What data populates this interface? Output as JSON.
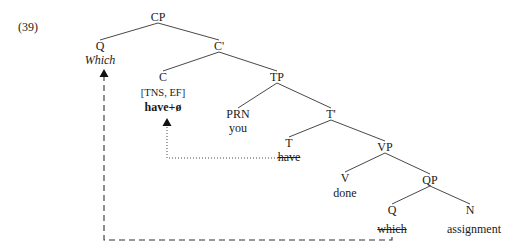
{
  "example": {
    "number": "(39)"
  },
  "tree": {
    "nodes": [
      {
        "id": "cp",
        "label": "CP",
        "x": 158,
        "y": 20
      },
      {
        "id": "q1",
        "label": "Q",
        "x": 100,
        "y": 49
      },
      {
        "id": "cbar",
        "label": "C'",
        "x": 219,
        "y": 49
      },
      {
        "id": "c",
        "label": "C",
        "x": 163,
        "y": 80
      },
      {
        "id": "tp",
        "label": "TP",
        "x": 277,
        "y": 80
      },
      {
        "id": "prn",
        "label": "PRN",
        "x": 238,
        "y": 117
      },
      {
        "id": "tbar",
        "label": "T'",
        "x": 331,
        "y": 117
      },
      {
        "id": "t",
        "label": "T",
        "x": 289,
        "y": 146
      },
      {
        "id": "vp",
        "label": "VP",
        "x": 385,
        "y": 150
      },
      {
        "id": "v",
        "label": "V",
        "x": 345,
        "y": 181
      },
      {
        "id": "qp",
        "label": "QP",
        "x": 430,
        "y": 183
      },
      {
        "id": "q2",
        "label": "Q",
        "x": 392,
        "y": 213
      },
      {
        "id": "n",
        "label": "N",
        "x": 470,
        "y": 213
      }
    ],
    "terminals": [
      {
        "id": "which-top",
        "text": "Which",
        "x": 100,
        "y": 63,
        "style": "italic"
      },
      {
        "id": "have-plus",
        "text": "have+ø",
        "x": 163,
        "y": 110,
        "style": "bold"
      },
      {
        "id": "you",
        "text": "you",
        "x": 238,
        "y": 131,
        "style": "plain"
      },
      {
        "id": "have-trace",
        "text": "have",
        "x": 289,
        "y": 160,
        "style": "struck"
      },
      {
        "id": "done",
        "text": "done",
        "x": 345,
        "y": 196,
        "style": "plain"
      },
      {
        "id": "which-trace",
        "text": "which",
        "x": 392,
        "y": 232,
        "style": "struck"
      },
      {
        "id": "assignment",
        "text": "assignment",
        "x": 474,
        "y": 232,
        "style": "plain"
      }
    ],
    "features": [
      {
        "id": "c-features",
        "text": "[TNS, EF]",
        "x": 163,
        "y": 95
      }
    ],
    "branches": [
      {
        "from": "cp",
        "to": "q1"
      },
      {
        "from": "cp",
        "to": "cbar"
      },
      {
        "from": "cbar",
        "to": "c"
      },
      {
        "from": "cbar",
        "to": "tp"
      },
      {
        "from": "tp",
        "to": "prn"
      },
      {
        "from": "tp",
        "to": "tbar"
      },
      {
        "from": "tbar",
        "to": "t"
      },
      {
        "from": "tbar",
        "to": "vp"
      },
      {
        "from": "vp",
        "to": "v"
      },
      {
        "from": "vp",
        "to": "qp"
      },
      {
        "from": "qp",
        "to": "q2"
      },
      {
        "from": "qp",
        "to": "n"
      }
    ],
    "movements": [
      {
        "id": "wh-movement",
        "type": "dashed",
        "label": "which-to-spec-cp",
        "path": "M 392 237 L 392 240 L 104 240 L 104 73",
        "arrow_x": 104,
        "arrow_y": 69
      },
      {
        "id": "head-movement",
        "type": "dotted",
        "label": "have-to-c",
        "path": "M 281 158 L 167 158 L 167 124",
        "arrow_x": 167,
        "arrow_y": 118
      }
    ]
  },
  "colors": {
    "line": "#333333",
    "text": "#1a1a1a",
    "background": "#ffffff"
  }
}
